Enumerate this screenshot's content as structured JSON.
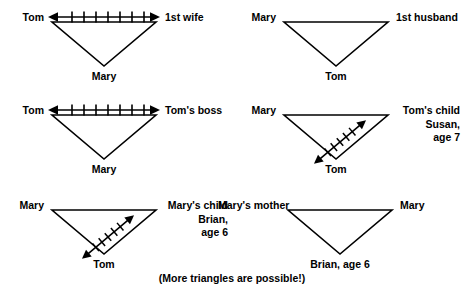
{
  "figure": {
    "caption": "(More triangles are possible!)",
    "line_color": "#000000",
    "background_color": "#ffffff"
  },
  "panels": [
    {
      "id": "panel-tom-1st-wife-mary",
      "top_left_label": "Tom",
      "top_right_label": "1st wife",
      "bottom_label": "Mary",
      "conflict_arrow": {
        "present": true,
        "orientation": "horizontal",
        "double_headed": true,
        "hatch_marks": 7,
        "between": "Tom and 1st wife"
      }
    },
    {
      "id": "panel-mary-1st-husband-tom",
      "top_left_label": "Mary",
      "top_right_label": "1st husband",
      "bottom_label": "Tom",
      "conflict_arrow": {
        "present": false,
        "orientation": "none",
        "double_headed": false,
        "hatch_marks": 0,
        "between": ""
      }
    },
    {
      "id": "panel-tom-boss-mary",
      "top_left_label": "Tom",
      "top_right_label": "Tom's boss",
      "bottom_label": "Mary",
      "conflict_arrow": {
        "present": true,
        "orientation": "horizontal",
        "double_headed": true,
        "hatch_marks": 7,
        "between": "Tom and Tom's boss"
      }
    },
    {
      "id": "panel-mary-toms-child-tom",
      "top_left_label": "Mary",
      "top_right_label": "Tom's child",
      "top_right_label_line2": "Susan,",
      "top_right_label_line3": "age 7",
      "bottom_label": "Tom",
      "conflict_arrow": {
        "present": true,
        "orientation": "diagonal",
        "double_headed": true,
        "hatch_marks": 5,
        "between": "Tom and Tom's child Susan"
      }
    },
    {
      "id": "panel-mary-marys-child-tom",
      "top_left_label": "Mary",
      "top_right_label": "Mary's child",
      "top_right_label_line2": "Brian,",
      "top_right_label_line3": "age 6",
      "bottom_label": "Tom",
      "conflict_arrow": {
        "present": true,
        "orientation": "diagonal",
        "double_headed": true,
        "hatch_marks": 5,
        "between": "Tom and Mary's child Brian"
      }
    },
    {
      "id": "panel-marys-mother-mary-brian",
      "top_left_label": "Mary's mother",
      "top_right_label": "Mary",
      "bottom_label": "Brian, age 6",
      "conflict_arrow": {
        "present": false,
        "orientation": "none",
        "double_headed": false,
        "hatch_marks": 0,
        "between": ""
      }
    }
  ]
}
